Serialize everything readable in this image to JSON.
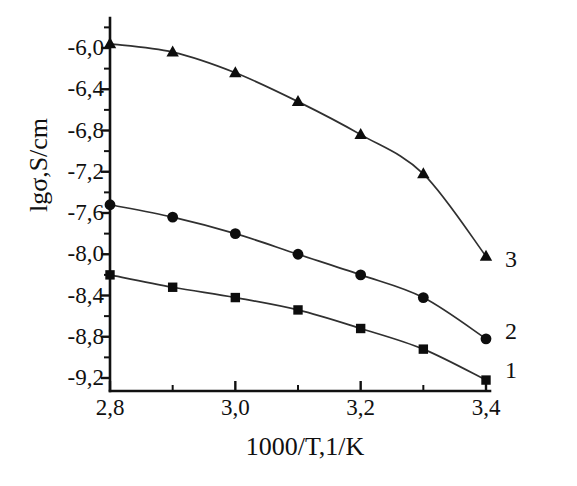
{
  "chart_data": {
    "type": "line",
    "title": "",
    "subtitle": "",
    "xlabel": "1000/T,1/K",
    "ylabel": "lgσ,S/cm",
    "x": [
      2.8,
      2.9,
      3.0,
      3.1,
      3.2,
      3.3,
      3.4
    ],
    "xlim": [
      2.8,
      3.4
    ],
    "ylim": [
      -9.4,
      -5.8
    ],
    "x_tick_labels": [
      "2,8",
      "3,0",
      "3,2",
      "3,4"
    ],
    "x_tick_values": [
      2.8,
      3.0,
      3.2,
      3.4
    ],
    "x_minor_tick_values": [
      2.9,
      3.1,
      3.3
    ],
    "y_tick_labels": [
      "-6,0",
      "-6,4",
      "-6,8",
      "-7,2",
      "-7,6",
      "-8,0",
      "-8,4",
      "-8,8",
      "-9,2"
    ],
    "y_tick_values": [
      -6.0,
      -6.4,
      -6.8,
      -7.2,
      -7.6,
      -8.0,
      -8.4,
      -8.8,
      -9.2
    ],
    "y_minor_tick_values": [
      -6.2,
      -6.6,
      -7.0,
      -7.4,
      -7.8,
      -8.2,
      -8.6,
      -9.0
    ],
    "grid": false,
    "legend_position": "right-inline",
    "line_color": "#303030",
    "marker_color": "#0d0d0d",
    "series": [
      {
        "name": "3",
        "label": "3",
        "marker": "triangle",
        "values": [
          -5.96,
          -6.04,
          -6.24,
          -6.52,
          -6.84,
          -7.22,
          -8.02
        ]
      },
      {
        "name": "2",
        "label": "2",
        "marker": "circle",
        "values": [
          -7.52,
          -7.64,
          -7.8,
          -8.0,
          -8.2,
          -8.42,
          -8.82
        ]
      },
      {
        "name": "1",
        "label": "1",
        "marker": "square",
        "values": [
          -8.2,
          -8.32,
          -8.42,
          -8.54,
          -8.72,
          -8.92,
          -9.22
        ]
      }
    ]
  },
  "axes": {
    "y_title": "lgσ,S/cm",
    "x_title": "1000/T,1/K"
  },
  "series_labels": {
    "s3": "3",
    "s2": "2",
    "s1": "1"
  }
}
